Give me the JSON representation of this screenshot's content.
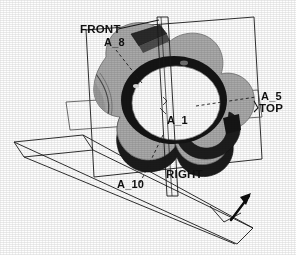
{
  "figure": {
    "background_color": "#fefefe",
    "body_fill": "#a9a9a9",
    "body_shadow": "#7d7d7d",
    "bore_fill": "#fdfdfd",
    "dark_fill": "#1b1b1b",
    "line_color": "#1a1a1a"
  },
  "planes": [
    {
      "id": "front-plane",
      "label": "FRONT",
      "label_x": 80,
      "label_y": 33,
      "leader": "M 118 29 L 157 21"
    },
    {
      "id": "top-plane",
      "label": "TOP",
      "label_x": 259,
      "label_y": 112,
      "leader": "M 253 104 L 258 108"
    },
    {
      "id": "right-plane",
      "label": "RIGHT",
      "label_x": 166,
      "label_y": 178,
      "leader": ""
    }
  ],
  "axes": [
    {
      "id": "axis-a8",
      "label": "A_8",
      "label_x": 104,
      "label_y": 46,
      "leader": "M 116 50 L 140 81"
    },
    {
      "id": "axis-a5",
      "label": "A_5",
      "label_x": 261,
      "label_y": 100,
      "leader": "M 198 105 L 258 97"
    },
    {
      "id": "axis-a1",
      "label": "A_1",
      "label_x": 167,
      "label_y": 124,
      "leader": ""
    },
    {
      "id": "axis-a10",
      "label": "A_10",
      "label_x": 117,
      "label_y": 188,
      "leader": "M 139 183 L 160 137"
    }
  ],
  "normal_arrow": {
    "id": "plane-normal-arrow",
    "path": "M 232 219 L 250 196",
    "head": "250,196 241,199 246,206"
  }
}
